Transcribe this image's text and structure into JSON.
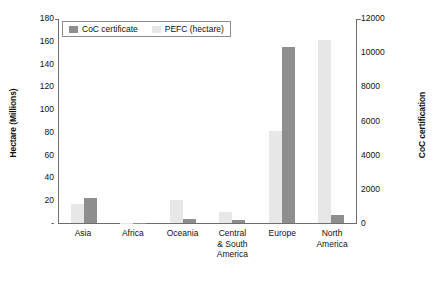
{
  "chart_data": {
    "type": "bar",
    "title": "",
    "subtitle": "",
    "xlabel": "",
    "ylabel": "Hectare (Millions)",
    "y2label": "CoC certification",
    "grid": false,
    "legend_position": "top-left",
    "categories": [
      "Asia",
      "Africa",
      "Oceania",
      "Central & South America",
      "Europe",
      "North America"
    ],
    "category_lines": [
      [
        "Asia"
      ],
      [
        "Africa"
      ],
      [
        "Oceania"
      ],
      [
        "Central",
        "& South",
        "America"
      ],
      [
        "Europe"
      ],
      [
        "North",
        "America"
      ]
    ],
    "series": [
      {
        "name": "CoC certificate",
        "axis": "right",
        "color": "#8e8e8e",
        "values": [
          1450,
          30,
          250,
          200,
          10300,
          470
        ]
      },
      {
        "name": "PEFC (hectare)",
        "axis": "left",
        "color": "#e7e7e7",
        "values": [
          17,
          0.3,
          20,
          10,
          81,
          161
        ]
      }
    ],
    "ylim": [
      0,
      180
    ],
    "yticks": [
      180,
      160,
      140,
      120,
      100,
      80,
      60,
      40,
      20,
      0
    ],
    "ytick_labels": [
      "180",
      "160",
      "140",
      "120",
      "100",
      "80",
      "60",
      "40",
      "20",
      "-"
    ],
    "y2lim": [
      0,
      12000
    ],
    "y2ticks": [
      12000,
      10000,
      8000,
      6000,
      4000,
      2000,
      0
    ],
    "y2tick_labels": [
      "12000",
      "10000",
      "8000",
      "6000",
      "4000",
      "2000",
      "0"
    ]
  },
  "legend": {
    "items": [
      {
        "label": "CoC certificate"
      },
      {
        "label": "PEFC (hectare)"
      }
    ]
  }
}
